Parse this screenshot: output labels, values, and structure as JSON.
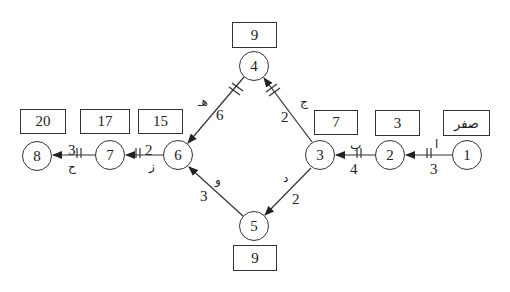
{
  "diagram": {
    "type": "network-diagram",
    "nodes": [
      {
        "id": "1",
        "label": "1",
        "time": "صفر"
      },
      {
        "id": "2",
        "label": "2",
        "time": "3"
      },
      {
        "id": "3",
        "label": "3",
        "time": "7"
      },
      {
        "id": "4",
        "label": "4",
        "time": "9"
      },
      {
        "id": "5",
        "label": "5",
        "time": "9"
      },
      {
        "id": "6",
        "label": "6",
        "time": "15"
      },
      {
        "id": "7",
        "label": "7",
        "time": "17"
      },
      {
        "id": "8",
        "label": "8",
        "time": "20"
      }
    ],
    "edges": [
      {
        "from": "1",
        "to": "2",
        "activity": "ا",
        "duration": "3",
        "critical": true
      },
      {
        "from": "2",
        "to": "3",
        "activity": "ب",
        "duration": "4",
        "critical": true
      },
      {
        "from": "3",
        "to": "4",
        "activity": "ج",
        "duration": "2",
        "critical": true
      },
      {
        "from": "3",
        "to": "5",
        "activity": "د",
        "duration": "2",
        "critical": false
      },
      {
        "from": "4",
        "to": "6",
        "activity": "هـ",
        "duration": "6",
        "critical": true
      },
      {
        "from": "5",
        "to": "6",
        "activity": "و",
        "duration": "3",
        "critical": false
      },
      {
        "from": "6",
        "to": "7",
        "activity": "ز",
        "duration": "2",
        "critical": true
      },
      {
        "from": "7",
        "to": "8",
        "activity": "ح",
        "duration": "3",
        "critical": true
      }
    ]
  }
}
